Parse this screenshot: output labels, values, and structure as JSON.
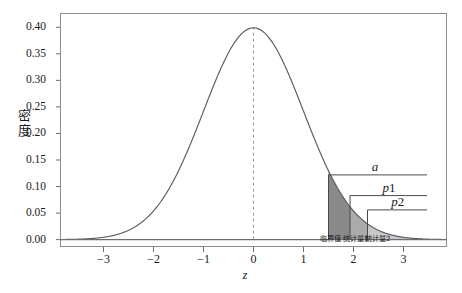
{
  "chart_data": {
    "type": "area",
    "title": "",
    "xlabel": "z",
    "ylabel": "密度",
    "xlim": [
      -3.85,
      3.85
    ],
    "ylim": [
      -0.012,
      0.425
    ],
    "grid": false,
    "legend_position": "none",
    "curve": {
      "name": "标准正态密度",
      "distribution": "standard normal",
      "mean": 0,
      "sd": 1,
      "peak_x": 0,
      "peak_y": 0.3989
    },
    "xticks": [
      "-3",
      "-2",
      "-1",
      "0",
      "1",
      "2",
      "3"
    ],
    "xtick_values": [
      -3,
      -2,
      -1,
      0,
      1,
      2,
      3
    ],
    "yticks": [
      "0.00",
      "0.05",
      "0.10",
      "0.15",
      "0.20",
      "0.25",
      "0.30",
      "0.35",
      "0.40"
    ],
    "ytick_values": [
      0.0,
      0.05,
      0.1,
      0.15,
      0.2,
      0.25,
      0.3,
      0.35,
      0.4
    ],
    "reference_line": {
      "name": "mean-line",
      "x": 0,
      "style": "dashed",
      "from_y": 0,
      "to_y": 0.3989
    },
    "shaded_regions": [
      {
        "name": "alpha-region",
        "label": "a",
        "from_x": 1.5,
        "to_x": 3.85,
        "color": "#8a8a8a",
        "density_at_start": 0.1295
      },
      {
        "name": "p1-region",
        "label": "p1",
        "from_x": 1.93,
        "to_x": 3.85,
        "color": "#ababab",
        "density_at_start": 0.062
      },
      {
        "name": "p2-region",
        "label": "p2",
        "from_x": 2.28,
        "to_x": 3.85,
        "color": "#c9c9c9",
        "density_at_start": 0.0297
      }
    ],
    "brackets": [
      {
        "name": "bracket-a",
        "label": "a",
        "start_x": 1.5,
        "end_x": 3.47,
        "y": 0.122
      },
      {
        "name": "bracket-p1",
        "label": "p1",
        "start_x": 1.93,
        "end_x": 3.47,
        "y": 0.083
      },
      {
        "name": "bracket-p2",
        "label": "p2",
        "start_x": 2.28,
        "end_x": 3.47,
        "y": 0.056
      }
    ],
    "axis_annotations": [
      {
        "name": "critical-value-label",
        "text": "临界值",
        "x": 1.62
      },
      {
        "name": "statistic1-label",
        "text": "统计量1",
        "x": 2.09
      },
      {
        "name": "statistic2-label",
        "text": "统计量2",
        "x": 2.53
      }
    ]
  },
  "labels": {
    "bracket_a": "a",
    "bracket_p1_base": "p",
    "bracket_p1_sub": "1",
    "bracket_p2_base": "p",
    "bracket_p2_sub": "2",
    "critical_value": "临界值",
    "statistic1": "统计量1",
    "statistic2": "统计量2",
    "y_axis_line1": "密",
    "y_axis_line2": "度",
    "x_axis": "z"
  },
  "colors": {
    "frame": "#8d8d8d",
    "curve": "#5a5a66",
    "axis": "#6e6e6e",
    "shade_dark": "#8a8a8a",
    "shade_mid": "#ababab",
    "shade_light": "#c9c9c9",
    "text": "#1a1a1a"
  }
}
